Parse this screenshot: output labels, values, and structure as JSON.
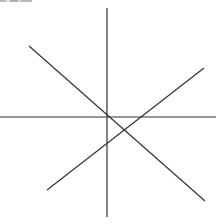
{
  "figure": {
    "width": 222,
    "height": 224,
    "background": "#ffffff",
    "line_color": "#333333",
    "lines": [
      {
        "name": "vertical-line",
        "x1": 107,
        "y1": 8,
        "x2": 107,
        "y2": 217
      },
      {
        "name": "horizontal-line",
        "x1": 0,
        "y1": 117,
        "x2": 216,
        "y2": 117
      },
      {
        "name": "diagonal-line-descending",
        "x1": 29,
        "y1": 46,
        "x2": 205,
        "y2": 201
      },
      {
        "name": "diagonal-line-ascending",
        "x1": 47,
        "y1": 190,
        "x2": 204,
        "y2": 68
      }
    ]
  }
}
